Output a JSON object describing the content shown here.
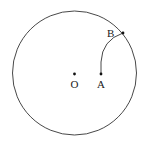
{
  "diagram": {
    "type": "geometry",
    "circle": {
      "cx": 74.5,
      "cy": 73,
      "r": 62,
      "stroke": "#333333"
    },
    "points": [
      {
        "id": "O",
        "label": "O",
        "x": 74.5,
        "y": 74,
        "label_x": 70.5,
        "label_y": 88
      },
      {
        "id": "A",
        "label": "A",
        "x": 101,
        "y": 74,
        "label_x": 97,
        "label_y": 88
      },
      {
        "id": "B",
        "label": "B",
        "x": 123,
        "y": 33,
        "label_x": 107,
        "label_y": 37
      }
    ],
    "arc": {
      "from": "A",
      "to": "B",
      "description": "arc from A to B on the circle"
    }
  }
}
